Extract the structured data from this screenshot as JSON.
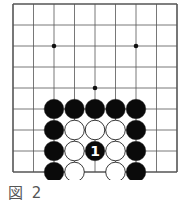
{
  "caption": "図 2",
  "board": {
    "cols": 9,
    "rows": 9,
    "origin_x": 13,
    "origin_y": 4,
    "dx": 20.5,
    "dy": 21,
    "line_color": "#555555",
    "star_points": [
      [
        2,
        2
      ],
      [
        6,
        2
      ],
      [
        4,
        4
      ]
    ],
    "stones": [
      {
        "col": 2,
        "row": 5,
        "color": "black"
      },
      {
        "col": 3,
        "row": 5,
        "color": "black"
      },
      {
        "col": 4,
        "row": 5,
        "color": "black"
      },
      {
        "col": 5,
        "row": 5,
        "color": "black"
      },
      {
        "col": 6,
        "row": 5,
        "color": "black"
      },
      {
        "col": 2,
        "row": 6,
        "color": "black"
      },
      {
        "col": 3,
        "row": 6,
        "color": "white"
      },
      {
        "col": 4,
        "row": 6,
        "color": "white"
      },
      {
        "col": 5,
        "row": 6,
        "color": "white"
      },
      {
        "col": 6,
        "row": 6,
        "color": "black"
      },
      {
        "col": 2,
        "row": 7,
        "color": "black"
      },
      {
        "col": 3,
        "row": 7,
        "color": "white"
      },
      {
        "col": 4,
        "row": 7,
        "color": "black",
        "label": "1"
      },
      {
        "col": 5,
        "row": 7,
        "color": "white"
      },
      {
        "col": 6,
        "row": 7,
        "color": "black"
      },
      {
        "col": 2,
        "row": 8,
        "color": "black"
      },
      {
        "col": 3,
        "row": 8,
        "color": "white"
      },
      {
        "col": 5,
        "row": 8,
        "color": "white"
      },
      {
        "col": 6,
        "row": 8,
        "color": "black"
      }
    ]
  }
}
